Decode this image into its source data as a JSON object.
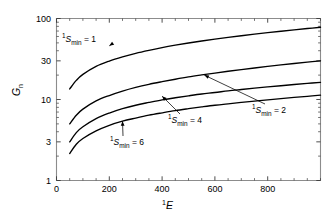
{
  "chart_data": {
    "type": "line",
    "title": "",
    "xlabel": "¹E",
    "ylabel": "Gₙ",
    "xlabel_parts": {
      "sup": "1",
      "italic": "E"
    },
    "ylabel_parts": {
      "italic": "G",
      "sub": "n"
    },
    "xscale": "linear",
    "yscale": "log",
    "xlim": [
      0,
      1000
    ],
    "ylim": [
      1,
      100
    ],
    "grid": false,
    "legend": "none (inline annotations with leader arrows)",
    "xticks": [
      0,
      200,
      400,
      600,
      800
    ],
    "xtick_labels": [
      "0",
      "200",
      "400",
      "600",
      "800"
    ],
    "xminor_step": 50,
    "yticks": [
      1,
      3,
      10,
      30,
      100
    ],
    "ytick_labels": [
      "1",
      "3",
      "10",
      "30",
      "100"
    ],
    "yminor": [
      2,
      4,
      5,
      6,
      7,
      8,
      9,
      20,
      40,
      50,
      60,
      70,
      80,
      90
    ],
    "series": [
      {
        "name": "¹S_min = 1",
        "label_sup": "1",
        "label_italic": "S",
        "label_sub": "min",
        "label_value": "1",
        "x": [
          50,
          75,
          100,
          150,
          200,
          250,
          300,
          350,
          400,
          450,
          500,
          550,
          600,
          650,
          700,
          750,
          800,
          850,
          900,
          950,
          1000
        ],
        "y": [
          13.5,
          17.2,
          20.4,
          25.6,
          29.8,
          33.6,
          37.2,
          40.5,
          43.7,
          46.8,
          49.8,
          52.7,
          55.6,
          58.4,
          61.2,
          64.0,
          66.8,
          69.6,
          72.4,
          75.2,
          78.0
        ]
      },
      {
        "name": "¹S_min = 2",
        "label_sup": "1",
        "label_italic": "S",
        "label_sub": "min",
        "label_value": "2",
        "x": [
          50,
          75,
          100,
          150,
          200,
          250,
          300,
          350,
          400,
          450,
          500,
          550,
          600,
          650,
          700,
          750,
          800,
          850,
          900,
          950,
          1000
        ],
        "y": [
          5.0,
          6.4,
          7.6,
          9.6,
          11.2,
          12.7,
          14.1,
          15.4,
          16.6,
          17.8,
          19.0,
          20.1,
          21.2,
          22.3,
          23.4,
          24.5,
          25.6,
          26.7,
          27.8,
          28.9,
          30.0
        ]
      },
      {
        "name": "¹S_min = 4",
        "label_sup": "1",
        "label_italic": "S",
        "label_sub": "min",
        "label_value": "4",
        "x": [
          50,
          75,
          100,
          150,
          200,
          250,
          300,
          350,
          400,
          450,
          500,
          550,
          600,
          650,
          700,
          750,
          800,
          850,
          900,
          950,
          1000
        ],
        "y": [
          3.0,
          3.9,
          4.6,
          5.8,
          6.8,
          7.7,
          8.5,
          9.2,
          9.9,
          10.5,
          11.1,
          11.7,
          12.2,
          12.8,
          13.3,
          13.8,
          14.3,
          14.8,
          15.3,
          15.8,
          16.3
        ]
      },
      {
        "name": "¹S_min = 6",
        "label_sup": "1",
        "label_italic": "S",
        "label_sub": "min",
        "label_value": "6",
        "x": [
          50,
          75,
          100,
          150,
          200,
          250,
          300,
          350,
          400,
          450,
          500,
          550,
          600,
          650,
          700,
          750,
          800,
          850,
          900,
          950,
          1000
        ],
        "y": [
          2.15,
          2.8,
          3.3,
          4.1,
          4.8,
          5.4,
          5.9,
          6.4,
          6.85,
          7.3,
          7.7,
          8.1,
          8.5,
          8.85,
          9.2,
          9.55,
          9.9,
          10.25,
          10.6,
          10.95,
          11.3
        ]
      }
    ],
    "annotations": [
      {
        "text": "¹S_min = 1",
        "sup": "1",
        "italic": "S",
        "sub": "min",
        "eq": "= 1",
        "anchor_x": 200,
        "anchor_y": 46
      },
      {
        "text": "¹S_min = 2",
        "sup": "1",
        "italic": "S",
        "sub": "min",
        "eq": "= 2",
        "anchor_x": 560,
        "anchor_y": 20
      },
      {
        "text": "¹S_min = 4",
        "sup": "1",
        "italic": "S",
        "sub": "min",
        "eq": "= 4",
        "anchor_x": 400,
        "anchor_y": 11
      },
      {
        "text": "¹S_min = 6",
        "sup": "1",
        "italic": "S",
        "sub": "min",
        "eq": "= 6",
        "anchor_x": 250,
        "anchor_y": 5.4
      }
    ],
    "colors": {
      "curve": "#000000",
      "axis": "#8c8c8c",
      "text": "#000000",
      "background": "#ffffff"
    }
  }
}
